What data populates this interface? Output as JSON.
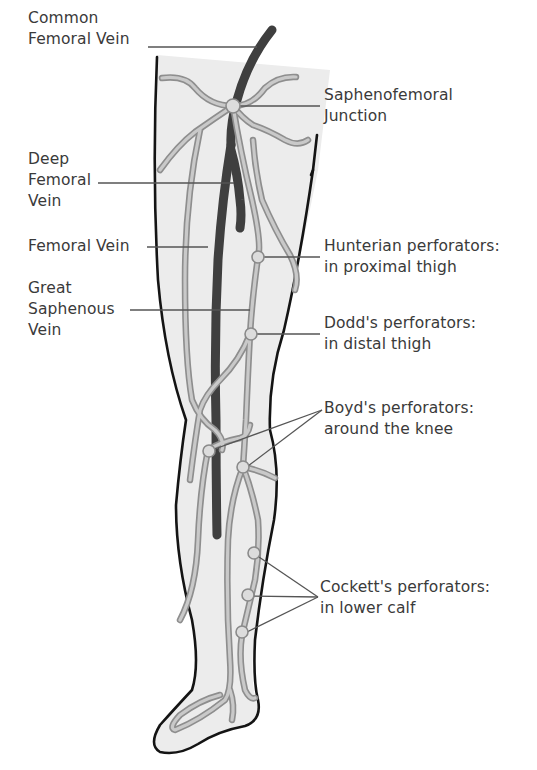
{
  "diagram": {
    "colors": {
      "deep_vein": "#3f3f3f",
      "superficial_vein": "#9a9a9a",
      "leg_fill": "#ececec",
      "outline": "#141414",
      "text": "#3a3a3a"
    },
    "labels_left": {
      "common_femoral_vein": "Common\nFemoral Vein",
      "deep_femoral_vein": "Deep\nFemoral\nVein",
      "femoral_vein": "Femoral Vein",
      "great_saphenous_vein": "Great\nSaphenous\nVein"
    },
    "labels_right": {
      "saphenofemoral_junction": "Saphenofemoral\nJunction",
      "hunterian_perforators": "Hunterian perforators:\nin proximal thigh",
      "dodds_perforators": "Dodd's perforators:\nin distal thigh",
      "boyds_perforators": "Boyd's perforators:\naround the knee",
      "cocketts_perforators": "Cockett's perforators:\nin lower calf"
    }
  }
}
